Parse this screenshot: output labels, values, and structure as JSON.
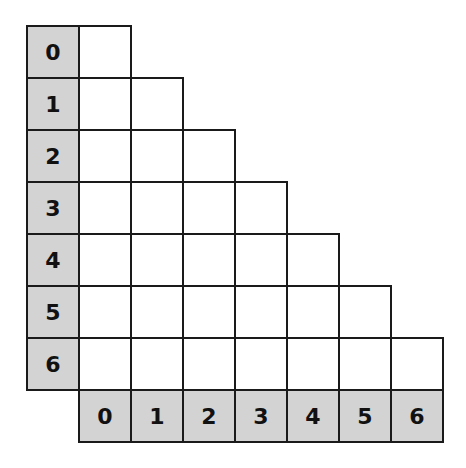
{
  "diagram": {
    "type": "triangular-grid",
    "row_labels": [
      "0",
      "1",
      "2",
      "3",
      "4",
      "5",
      "6"
    ],
    "col_labels": [
      "0",
      "1",
      "2",
      "3",
      "4",
      "5",
      "6"
    ],
    "colors": {
      "header_fill": "#d3d3d3",
      "cell_fill": "#ffffff",
      "border": "#1a1a1a"
    }
  }
}
